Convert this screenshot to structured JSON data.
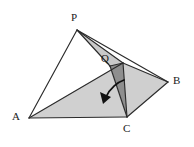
{
  "figure": {
    "kind": "geometry-diagram",
    "background_color": "#ffffff",
    "stroke_color": "#2b2b2b",
    "fill_light": "#d6d6d6",
    "fill_mid": "#c6c6c6",
    "fill_dark": "#8e8e8e",
    "arrow_color": "#111111",
    "labels": [
      {
        "id": "P",
        "text": "P",
        "x": 71,
        "y": 12
      },
      {
        "id": "Q",
        "text": "Q",
        "x": 101,
        "y": 53
      },
      {
        "id": "B",
        "text": "B",
        "x": 173,
        "y": 75
      },
      {
        "id": "A",
        "text": "A",
        "x": 12,
        "y": 111
      },
      {
        "id": "C",
        "text": "C",
        "x": 123,
        "y": 123
      }
    ],
    "points": {
      "P": {
        "x": 77,
        "y": 30
      },
      "Q": {
        "x": 110,
        "y": 66
      },
      "R": {
        "x": 123,
        "y": 63
      },
      "B": {
        "x": 168,
        "y": 82
      },
      "A": {
        "x": 29,
        "y": 118
      },
      "C": {
        "x": 127,
        "y": 117
      }
    },
    "polygons": [
      {
        "name": "face-P-R-Q",
        "fill": "#c9c9c9",
        "points": "77,30 123,63 110,66"
      },
      {
        "name": "face-A-R-C",
        "fill": "#d0d0d0",
        "points": "29,118 123,63 127,117"
      },
      {
        "name": "face-R-B-C",
        "fill": "#cfcfcf",
        "points": "123,63 168,82 127,117"
      },
      {
        "name": "face-Q-R-C-dark",
        "fill": "#8e8e8e",
        "points": "110,66 123,63 127,117"
      }
    ],
    "edges": [
      {
        "name": "edge-P-A",
        "from": "P",
        "to": "A"
      },
      {
        "name": "edge-P-Q",
        "from": "P",
        "to": "Q"
      },
      {
        "name": "edge-P-R",
        "from": "P",
        "to": "R"
      },
      {
        "name": "edge-P-B",
        "from": "P",
        "to": "B"
      },
      {
        "name": "edge-A-C",
        "from": "A",
        "to": "C"
      },
      {
        "name": "edge-A-R",
        "from": "A",
        "to": "R"
      },
      {
        "name": "edge-Q-C",
        "from": "Q",
        "to": "C"
      },
      {
        "name": "edge-Q-R",
        "from": "Q",
        "to": "R"
      },
      {
        "name": "edge-R-C",
        "from": "R",
        "to": "C"
      },
      {
        "name": "edge-R-B",
        "from": "R",
        "to": "B"
      },
      {
        "name": "edge-C-B",
        "from": "C",
        "to": "B"
      }
    ],
    "arrow": {
      "name": "fold-direction-arrow",
      "path": "M 124 80 C 118 82 110 88 106 97",
      "head": "104,103 100,93 111,96",
      "color": "#111111"
    }
  }
}
